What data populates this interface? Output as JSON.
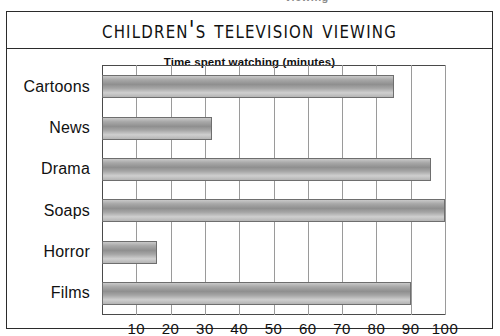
{
  "page": {
    "top_sliver_text": "viewing"
  },
  "figure": {
    "title": "Children's Television Viewing",
    "subtitle": "Time spent watching (minutes)"
  },
  "chart_data": {
    "type": "bar",
    "orientation": "horizontal",
    "title": "Children's Television Viewing",
    "subtitle": "Time spent watching (minutes)",
    "xlabel": "Time spent watching (minutes)",
    "ylabel": "",
    "xlim": [
      0,
      100
    ],
    "xticks": [
      10,
      20,
      30,
      40,
      50,
      60,
      70,
      80,
      90,
      100
    ],
    "xtick_labels": [
      "10",
      "20",
      "30",
      "40",
      "50",
      "60",
      "70",
      "80",
      "90",
      "100"
    ],
    "grid": true,
    "grid_axis": "x",
    "legend": false,
    "bar_style": "3d-cylinder-gradient",
    "bar_color": "#a8a8a8",
    "bar_edge_color": "#6e6e6e",
    "categories": [
      "Cartoons",
      "News",
      "Drama",
      "Soaps",
      "Horror",
      "Films"
    ],
    "values": [
      85,
      32,
      96,
      100,
      16,
      90
    ],
    "points": [
      {
        "category": "Cartoons",
        "value": 85
      },
      {
        "category": "News",
        "value": 32
      },
      {
        "category": "Drama",
        "value": 96
      },
      {
        "category": "Soaps",
        "value": 100
      },
      {
        "category": "Horror",
        "value": 16
      },
      {
        "category": "Films",
        "value": 90
      }
    ]
  }
}
